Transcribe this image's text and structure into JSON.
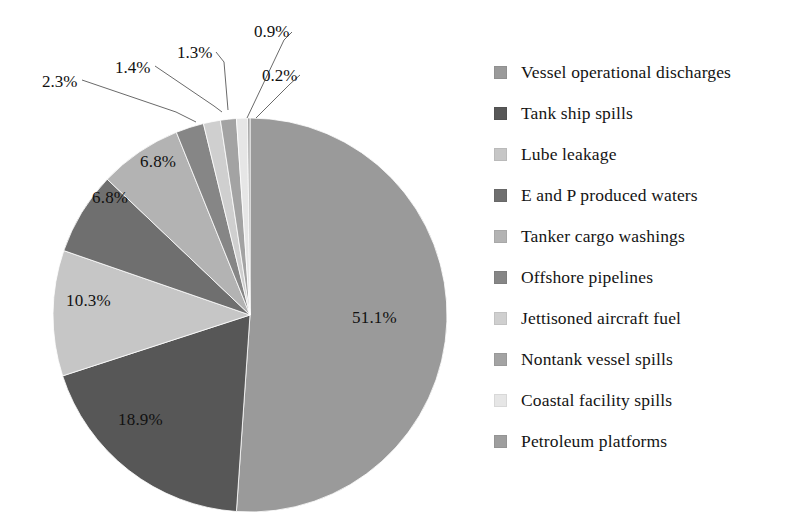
{
  "chart_data": {
    "type": "pie",
    "title": "",
    "subtitle": "",
    "xlabel": "",
    "ylabel": "",
    "legend_position": "right",
    "grid": false,
    "start_angle_deg": 0,
    "direction": "clockwise",
    "units": "percent",
    "categories": [
      "Vessel operational discharges",
      "Tank ship spills",
      "Lube leakage",
      "E and P produced waters",
      "Tanker cargo washings",
      "Offshore pipelines",
      "Jettisoned aircraft fuel",
      "Nontank vessel spills",
      "Coastal facility spills",
      "Petroleum platforms"
    ],
    "values": [
      51.1,
      18.9,
      10.3,
      6.8,
      6.8,
      2.3,
      1.4,
      1.3,
      0.9,
      0.2
    ],
    "labels": [
      "51.1%",
      "18.9%",
      "10.3%",
      "6.8%",
      "6.8%",
      "2.3%",
      "1.4%",
      "1.3%",
      "0.9%",
      "0.2%"
    ],
    "colors": [
      "#9a9a9a",
      "#575757",
      "#c6c6c6",
      "#6f6f6f",
      "#b3b3b3",
      "#868686",
      "#cfcfcf",
      "#a3a3a3",
      "#e6e6e6",
      "#9e9e9e"
    ],
    "label_placement": [
      "inside",
      "inside",
      "inside",
      "inside",
      "inside",
      "outside",
      "outside",
      "outside",
      "outside",
      "outside"
    ]
  },
  "legend": {
    "items": [
      {
        "label": "Vessel operational discharges",
        "color": "#9a9a9a"
      },
      {
        "label": "Tank ship spills",
        "color": "#575757"
      },
      {
        "label": "Lube leakage",
        "color": "#c6c6c6"
      },
      {
        "label": "E and P produced waters",
        "color": "#6f6f6f"
      },
      {
        "label": "Tanker cargo washings",
        "color": "#b3b3b3"
      },
      {
        "label": "Offshore pipelines",
        "color": "#868686"
      },
      {
        "label": "Jettisoned aircraft fuel",
        "color": "#cfcfcf"
      },
      {
        "label": "Nontank vessel spills",
        "color": "#a3a3a3"
      },
      {
        "label": "Coastal facility spills",
        "color": "#e6e6e6"
      },
      {
        "label": "Petroleum platforms",
        "color": "#9e9e9e"
      }
    ]
  },
  "pie_labels": {
    "inside": [
      {
        "text": "51.1%",
        "x": 352,
        "y": 308
      },
      {
        "text": "18.9%",
        "x": 118,
        "y": 410
      },
      {
        "text": "10.3%",
        "x": 66,
        "y": 291
      },
      {
        "text": "6.8%",
        "x": 92,
        "y": 188
      },
      {
        "text": "6.8%",
        "x": 140,
        "y": 152
      }
    ],
    "outside": [
      {
        "text": "2.3%",
        "x": 42,
        "y": 72
      },
      {
        "text": "1.4%",
        "x": 115,
        "y": 58
      },
      {
        "text": "1.3%",
        "x": 177,
        "y": 43
      },
      {
        "text": "0.9%",
        "x": 254,
        "y": 22
      },
      {
        "text": "0.2%",
        "x": 262,
        "y": 66
      }
    ]
  }
}
